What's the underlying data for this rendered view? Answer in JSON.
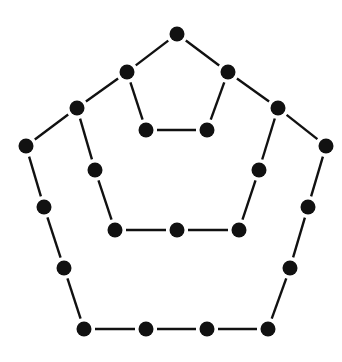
{
  "diagram": {
    "colors": {
      "background": "#ffffff",
      "dot": "#111111",
      "line": "#111111"
    },
    "dot_radius": 7.5,
    "line_width": 2.4,
    "gap": 11,
    "nodes": [
      {
        "id": "t",
        "x": 177,
        "y": 34
      },
      {
        "id": "a",
        "x": 127,
        "y": 72
      },
      {
        "id": "b",
        "x": 228,
        "y": 72
      },
      {
        "id": "c",
        "x": 146,
        "y": 130
      },
      {
        "id": "d",
        "x": 207,
        "y": 130
      },
      {
        "id": "m1",
        "x": 77,
        "y": 108
      },
      {
        "id": "m2",
        "x": 278,
        "y": 108
      },
      {
        "id": "m3",
        "x": 95,
        "y": 170
      },
      {
        "id": "m4",
        "x": 259,
        "y": 170
      },
      {
        "id": "m5",
        "x": 115,
        "y": 230
      },
      {
        "id": "m6",
        "x": 177,
        "y": 230
      },
      {
        "id": "m7",
        "x": 239,
        "y": 230
      },
      {
        "id": "o1",
        "x": 26,
        "y": 146
      },
      {
        "id": "o2",
        "x": 326,
        "y": 146
      },
      {
        "id": "o3",
        "x": 44,
        "y": 207
      },
      {
        "id": "o4",
        "x": 308,
        "y": 207
      },
      {
        "id": "o5",
        "x": 64,
        "y": 268
      },
      {
        "id": "o6",
        "x": 290,
        "y": 268
      },
      {
        "id": "o7",
        "x": 84,
        "y": 329
      },
      {
        "id": "o8",
        "x": 146,
        "y": 329
      },
      {
        "id": "o9",
        "x": 207,
        "y": 329
      },
      {
        "id": "o10",
        "x": 268,
        "y": 329
      }
    ],
    "edges": [
      [
        "t",
        "a"
      ],
      [
        "t",
        "b"
      ],
      [
        "a",
        "c"
      ],
      [
        "b",
        "d"
      ],
      [
        "c",
        "d"
      ],
      [
        "a",
        "m1"
      ],
      [
        "b",
        "m2"
      ],
      [
        "m1",
        "m3"
      ],
      [
        "m2",
        "m4"
      ],
      [
        "m3",
        "m5"
      ],
      [
        "m4",
        "m7"
      ],
      [
        "m5",
        "m6"
      ],
      [
        "m6",
        "m7"
      ],
      [
        "m1",
        "o1"
      ],
      [
        "m2",
        "o2"
      ],
      [
        "o1",
        "o3"
      ],
      [
        "o2",
        "o4"
      ],
      [
        "o3",
        "o5"
      ],
      [
        "o4",
        "o6"
      ],
      [
        "o5",
        "o7"
      ],
      [
        "o6",
        "o10"
      ],
      [
        "o7",
        "o8"
      ],
      [
        "o8",
        "o9"
      ],
      [
        "o9",
        "o10"
      ]
    ]
  }
}
